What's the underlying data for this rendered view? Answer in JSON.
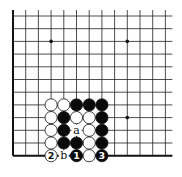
{
  "diagram": {
    "type": "go-board-fragment",
    "grid": {
      "columns": 13,
      "rows": 12,
      "origin_x": 13,
      "origin_y": 16,
      "spacing_x": 12.7,
      "spacing_y": 12.7,
      "top_open": true,
      "right_open": true,
      "left_edge": true,
      "bottom_edge": true,
      "line_color": "#222222",
      "edge_color": "#111111"
    },
    "star_points": [
      {
        "col": 3,
        "row": 2
      },
      {
        "col": 9,
        "row": 2
      },
      {
        "col": 9,
        "row": 8
      }
    ],
    "stones": [
      {
        "col": 3,
        "row": 7,
        "color": "white",
        "label": ""
      },
      {
        "col": 4,
        "row": 7,
        "color": "white",
        "label": ""
      },
      {
        "col": 5,
        "row": 7,
        "color": "black",
        "label": ""
      },
      {
        "col": 6,
        "row": 7,
        "color": "black",
        "label": ""
      },
      {
        "col": 7,
        "row": 7,
        "color": "black",
        "label": ""
      },
      {
        "col": 3,
        "row": 8,
        "color": "white",
        "label": ""
      },
      {
        "col": 4,
        "row": 8,
        "color": "black",
        "label": ""
      },
      {
        "col": 5,
        "row": 8,
        "color": "white",
        "label": ""
      },
      {
        "col": 6,
        "row": 8,
        "color": "white",
        "label": ""
      },
      {
        "col": 7,
        "row": 8,
        "color": "black",
        "label": ""
      },
      {
        "col": 3,
        "row": 9,
        "color": "white",
        "label": ""
      },
      {
        "col": 4,
        "row": 9,
        "color": "black",
        "label": ""
      },
      {
        "col": 6,
        "row": 9,
        "color": "white",
        "label": ""
      },
      {
        "col": 7,
        "row": 9,
        "color": "black",
        "label": ""
      },
      {
        "col": 3,
        "row": 10,
        "color": "white",
        "label": ""
      },
      {
        "col": 4,
        "row": 10,
        "color": "black",
        "label": ""
      },
      {
        "col": 5,
        "row": 10,
        "color": "black",
        "label": ""
      },
      {
        "col": 6,
        "row": 10,
        "color": "white",
        "label": ""
      },
      {
        "col": 7,
        "row": 10,
        "color": "black",
        "label": ""
      },
      {
        "col": 3,
        "row": 11,
        "color": "white",
        "label": "2"
      },
      {
        "col": 5,
        "row": 11,
        "color": "black",
        "label": "1"
      },
      {
        "col": 6,
        "row": 11,
        "color": "white",
        "label": ""
      },
      {
        "col": 7,
        "row": 11,
        "color": "black",
        "label": "3"
      }
    ],
    "point_labels": [
      {
        "col": 5,
        "row": 9,
        "text": "a"
      },
      {
        "col": 4,
        "row": 11,
        "text": "b"
      }
    ]
  }
}
